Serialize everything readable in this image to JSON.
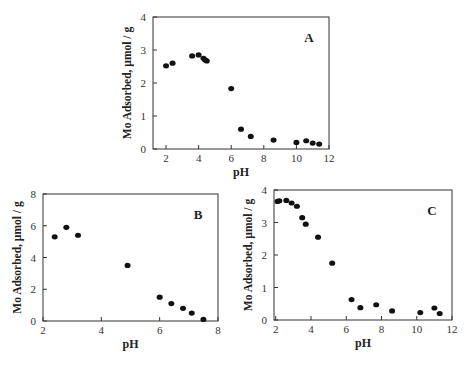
{
  "chart_data": [
    {
      "id": "A",
      "type": "scatter",
      "panel_label": "A",
      "xlabel": "pH",
      "ylabel": "Mo Adsorbed, µmol / g",
      "xlim": [
        1.2,
        12
      ],
      "ylim": [
        0,
        4
      ],
      "xticks": [
        2,
        4,
        6,
        8,
        10,
        12
      ],
      "yticks": [
        0,
        1,
        2,
        3,
        4
      ],
      "grid": false,
      "legend": null,
      "frame": {
        "left": 153,
        "top": 17,
        "right": 329,
        "bottom": 149
      },
      "x": [
        2.0,
        2.4,
        3.6,
        4.0,
        4.3,
        4.4,
        4.5,
        6.0,
        6.6,
        7.2,
        8.6,
        10.0,
        10.6,
        11.0,
        11.4
      ],
      "y": [
        2.52,
        2.6,
        2.82,
        2.85,
        2.75,
        2.7,
        2.67,
        1.83,
        0.6,
        0.38,
        0.27,
        0.2,
        0.25,
        0.18,
        0.15
      ]
    },
    {
      "id": "B",
      "type": "scatter",
      "panel_label": "B",
      "xlabel": "pH",
      "ylabel": "Mo Adsorbed, µmol / g",
      "xlim": [
        2,
        8
      ],
      "ylim": [
        0,
        8
      ],
      "xticks": [
        2,
        4,
        6,
        8
      ],
      "yticks": [
        0,
        2,
        4,
        6,
        8
      ],
      "grid": false,
      "legend": null,
      "frame": {
        "left": 43,
        "top": 194,
        "right": 218,
        "bottom": 321
      },
      "x": [
        2.4,
        2.8,
        3.2,
        4.9,
        6.0,
        6.4,
        6.8,
        7.1,
        7.5
      ],
      "y": [
        5.3,
        5.9,
        5.4,
        3.5,
        1.5,
        1.1,
        0.8,
        0.5,
        0.1
      ]
    },
    {
      "id": "C",
      "type": "scatter",
      "panel_label": "C",
      "xlabel": "pH",
      "ylabel": "Mo Adsorbed, µmol / g",
      "xlim": [
        1.9,
        12
      ],
      "ylim": [
        0,
        4
      ],
      "xticks": [
        2,
        4,
        6,
        8,
        10,
        12
      ],
      "yticks": [
        0,
        1,
        2,
        3,
        4
      ],
      "grid": false,
      "legend": null,
      "frame": {
        "left": 274,
        "top": 190,
        "right": 452,
        "bottom": 320
      },
      "x": [
        2.1,
        2.2,
        2.6,
        2.9,
        3.2,
        3.5,
        3.7,
        4.4,
        5.2,
        6.3,
        6.8,
        7.7,
        8.6,
        10.2,
        11.0,
        11.3
      ],
      "y": [
        3.65,
        3.67,
        3.68,
        3.6,
        3.5,
        3.15,
        2.95,
        2.55,
        1.75,
        0.63,
        0.38,
        0.47,
        0.28,
        0.23,
        0.37,
        0.2
      ]
    }
  ]
}
